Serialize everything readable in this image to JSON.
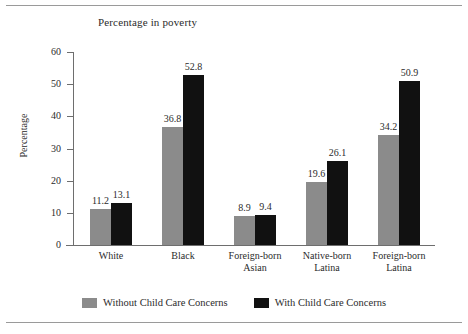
{
  "chart_data": {
    "type": "bar",
    "title": "Percentage in poverty",
    "xlabel": "",
    "ylabel": "Percentage",
    "ylim": [
      0,
      60
    ],
    "yticks": [
      0,
      10,
      20,
      30,
      40,
      50,
      60
    ],
    "grid": false,
    "legend_position": "bottom",
    "categories": [
      "White",
      "Foreign-born\nAsian",
      "Black",
      "Native-born\nLatina",
      "Foreign-born\nLatina"
    ],
    "category_lines": [
      [
        "White"
      ],
      [
        "Black"
      ],
      [
        "Foreign-born",
        "Asian"
      ],
      [
        "Native-born",
        "Latina"
      ],
      [
        "Foreign-born",
        "Latina"
      ]
    ],
    "series": [
      {
        "name": "Without Child Care Concerns",
        "color": "#8b8b8b",
        "values": [
          11.2,
          36.8,
          8.9,
          19.6,
          34.2
        ],
        "labels": [
          "11.2",
          "36.8",
          "8.9",
          "19.6",
          "34.2"
        ]
      },
      {
        "name": "With Child Care Concerns",
        "color": "#111111",
        "values": [
          13.1,
          52.8,
          9.4,
          26.1,
          50.9
        ],
        "labels": [
          "13.1",
          "52.8",
          "9.4",
          "26.1",
          "50.9"
        ]
      }
    ]
  },
  "legend": {
    "items": [
      {
        "label": "Without Child Care Concerns",
        "color": "#8b8b8b"
      },
      {
        "label": "With Child Care Concerns",
        "color": "#111111"
      }
    ]
  }
}
